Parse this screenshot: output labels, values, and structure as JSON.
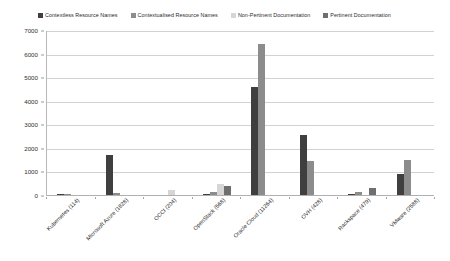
{
  "chart_data": {
    "type": "bar",
    "title": "",
    "subtitle": "",
    "xlabel": "",
    "ylabel": "",
    "ylim": [
      0,
      7000
    ],
    "ytick_labels": [
      "0",
      "1000",
      "2000",
      "3000",
      "4000",
      "5000",
      "6000",
      "7000"
    ],
    "ytick_values": [
      0,
      1000,
      2000,
      3000,
      4000,
      5000,
      6000,
      7000
    ],
    "grid": true,
    "grid_axis": "y",
    "legend_position": "top",
    "categories": [
      "Kubernetes (114)",
      "Microsoft Azure (1828)",
      "OCCI (204)",
      "OpenStack (568)",
      "Oracle Cloud (11264)",
      "OVH (428)",
      "Rackspace (479)",
      "VMware (2588)"
    ],
    "series": [
      {
        "name": "Contextless Resource Names",
        "color": "#3f3f3f",
        "values": [
          60,
          1700,
          0,
          60,
          4600,
          2550,
          30,
          900
        ]
      },
      {
        "name": "Contextualised Resource Names",
        "color": "#8c8c8c",
        "values": [
          60,
          70,
          0,
          120,
          6400,
          1450,
          110,
          1500
        ]
      },
      {
        "name": "Non-Pertinent Documentation",
        "color": "#d6d6d6",
        "values": [
          0,
          0,
          200,
          460,
          0,
          0,
          0,
          0
        ]
      },
      {
        "name": "Pertinent Documentation",
        "color": "#6f6f6f",
        "values": [
          0,
          0,
          0,
          400,
          0,
          0,
          300,
          0
        ]
      }
    ]
  },
  "legend": {
    "items": [
      {
        "label": "Contextless Resource Names",
        "color": "#3f3f3f"
      },
      {
        "label": "Contextualised Resource Names",
        "color": "#8c8c8c"
      },
      {
        "label": "Non-Pertinent Documentation",
        "color": "#d6d6d6"
      },
      {
        "label": "Pertinent Documentation",
        "color": "#6f6f6f"
      }
    ]
  },
  "axis": {
    "y_labels": [
      "7000",
      "6000",
      "5000",
      "4000",
      "3000",
      "2000",
      "1000",
      "0"
    ],
    "x_labels": [
      "Kubernetes (114)",
      "Microsoft Azure (1828)",
      "OCCI (204)",
      "OpenStack (568)",
      "Oracle Cloud (11264)",
      "OVH (428)",
      "Rackspace (479)",
      "VMware (2588)"
    ]
  }
}
